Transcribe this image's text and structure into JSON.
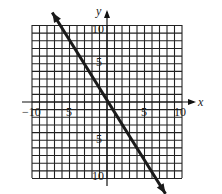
{
  "chart_data": {
    "type": "line",
    "title": "",
    "xlabel": "x",
    "ylabel": "y",
    "xlim": [
      -10,
      10
    ],
    "ylim": [
      -10,
      10
    ],
    "grid": true,
    "grid_step": 1,
    "x_tick_labels": [
      "-10",
      "5",
      "5",
      "10"
    ],
    "x_tick_values": [
      -10,
      -5,
      5,
      10
    ],
    "y_tick_labels": [
      "10",
      "5",
      "5",
      "10"
    ],
    "y_tick_values": [
      10,
      5,
      -5,
      -10
    ],
    "series": [
      {
        "name": "line",
        "x": [
          -7.3,
          7.8
        ],
        "y": [
          11.7,
          -12
        ],
        "arrows": "both",
        "slope_approx": -1.5,
        "x_intercept_approx": 1,
        "y_intercept_approx": 1.5
      }
    ],
    "colors": {
      "line": "#1a1a1a",
      "grid": "#222222",
      "background": "#ffffff"
    }
  }
}
